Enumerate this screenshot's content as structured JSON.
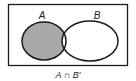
{
  "diagram": {
    "type": "venn",
    "sets": [
      {
        "name": "A",
        "label": "A"
      },
      {
        "name": "B",
        "label": "B"
      }
    ],
    "shaded_region": "A only (A minus B)",
    "caption": "A ∩ B′",
    "colors": {
      "shade": "#a9a9a9",
      "stroke": "#1a1a1a",
      "background": "#ffffff"
    }
  }
}
